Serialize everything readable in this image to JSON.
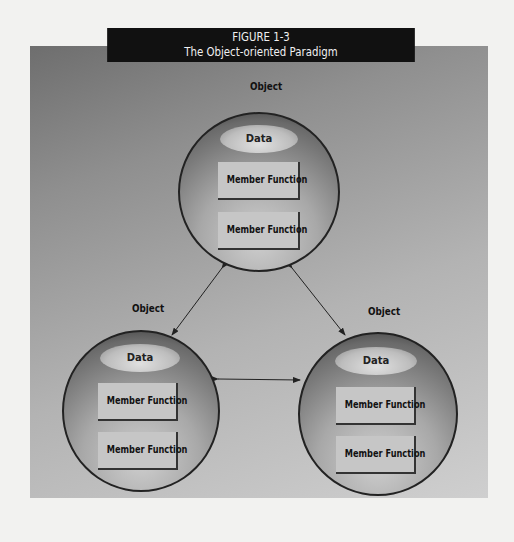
{
  "figure": {
    "number": "FIGURE 1-3",
    "title": "The Object-oriented Paradigm"
  },
  "objects": [
    {
      "label": "Object",
      "data_label": "Data",
      "members": [
        "Member Function",
        "Member Function"
      ],
      "position": "top"
    },
    {
      "label": "Object",
      "data_label": "Data",
      "members": [
        "Member Function",
        "Member Function"
      ],
      "position": "bottom-left"
    },
    {
      "label": "Object",
      "data_label": "Data",
      "members": [
        "Member Function",
        "Member Function"
      ],
      "position": "bottom-right"
    }
  ],
  "connections": [
    {
      "from": "top",
      "to": "bottom-left",
      "type": "bidirectional"
    },
    {
      "from": "top",
      "to": "bottom-right",
      "type": "bidirectional"
    },
    {
      "from": "bottom-left",
      "to": "bottom-right",
      "type": "bidirectional"
    }
  ]
}
